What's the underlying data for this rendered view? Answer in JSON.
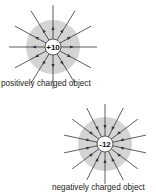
{
  "diagrams": [
    {
      "label": "+10",
      "caption": "positively charged object",
      "charge_sign": "positive",
      "field_direction": "outward",
      "field_line_count": 12
    },
    {
      "label": "-12",
      "caption": "negatively charged object",
      "charge_sign": "negative",
      "field_direction": "inward",
      "field_line_count": 14
    }
  ],
  "colors": {
    "halo": "#d4d4d4",
    "line": "#333333",
    "core_fill": "#ffffff"
  }
}
